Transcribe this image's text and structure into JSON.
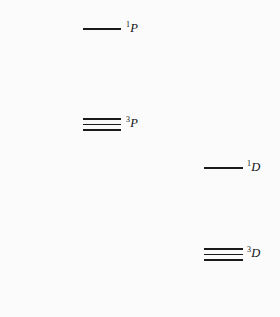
{
  "figure": {
    "type": "energy-level-diagram",
    "background_color": "#fbfbfb",
    "line_color": "#1a1a1a",
    "text_color": "#111111",
    "width": 280,
    "height": 317
  },
  "levels": [
    {
      "id": "singlet-p",
      "multiplicity": "1",
      "orbital": "P",
      "label": "1P",
      "sublevel_count": 1,
      "column": "left",
      "line_x": 83,
      "line_width": 38,
      "line_tops": [
        28
      ],
      "label_x": 126,
      "label_y": 22
    },
    {
      "id": "triplet-p",
      "multiplicity": "3",
      "orbital": "P",
      "label": "3P",
      "sublevel_count": 3,
      "column": "left",
      "line_x": 83,
      "line_width": 38,
      "line_tops": [
        118,
        123.5,
        129
      ],
      "label_x": 126,
      "label_y": 117
    },
    {
      "id": "singlet-d",
      "multiplicity": "1",
      "orbital": "D",
      "label": "1D",
      "sublevel_count": 1,
      "column": "right",
      "line_x": 204,
      "line_width": 39,
      "line_tops": [
        167
      ],
      "label_x": 247,
      "label_y": 161
    },
    {
      "id": "triplet-d",
      "multiplicity": "3",
      "orbital": "D",
      "label": "3D",
      "sublevel_count": 3,
      "column": "right",
      "line_x": 204,
      "line_width": 39,
      "line_tops": [
        248,
        253.5,
        259
      ],
      "label_x": 247,
      "label_y": 247
    }
  ]
}
